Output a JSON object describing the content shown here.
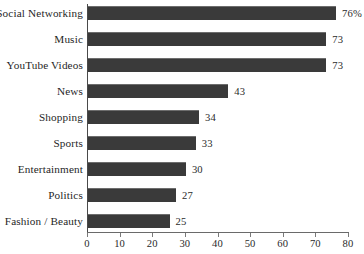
{
  "chart_data": {
    "type": "bar",
    "orientation": "horizontal",
    "title": "",
    "subtitle": "",
    "xlabel": "",
    "ylabel": "",
    "categories": [
      "Social Networking",
      "Music",
      "YouTube Videos",
      "News",
      "Shopping",
      "Sports",
      "Entertainment",
      "Politics",
      "Fashion / Beauty"
    ],
    "values": [
      76,
      73,
      73,
      43,
      34,
      33,
      30,
      27,
      25
    ],
    "value_labels": [
      "76%",
      "73",
      "73",
      "43",
      "34",
      "33",
      "30",
      "27",
      "25"
    ],
    "xlim": [
      0,
      80
    ],
    "xticks": [
      0,
      10,
      20,
      30,
      40,
      50,
      60,
      70,
      80
    ],
    "xtick_labels": [
      "0",
      "10",
      "20",
      "30",
      "40",
      "50",
      "60",
      "70",
      "80"
    ],
    "grid": false,
    "legend": null,
    "bar_color": "#3a3a3a",
    "background_color": "#ffffff",
    "axis_color": "#5a5a5a"
  }
}
